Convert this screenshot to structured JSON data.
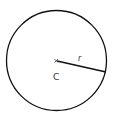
{
  "diagram": {
    "type": "circle-radius",
    "circle": {
      "cx": 56.5,
      "cy": 60.5,
      "r": 50,
      "stroke": "#111111"
    },
    "center_mark": {
      "symbol": "×",
      "x": 56,
      "y": 61
    },
    "radius_line": {
      "x1": 57,
      "y1": 61,
      "x2": 106,
      "y2": 72
    },
    "labels": {
      "center": "C",
      "radius": "r"
    }
  }
}
